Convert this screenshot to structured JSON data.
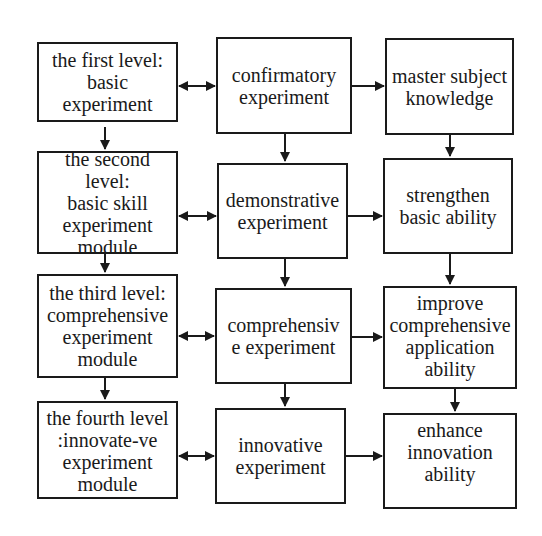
{
  "diagram": {
    "type": "flowchart",
    "colors": {
      "stroke": "#1a1a1a",
      "background": "#ffffff",
      "text": "#1a1a1a"
    },
    "columns": {
      "levels": [
        {
          "id": "level1",
          "label": "the first level:\nbasic\nexperiment"
        },
        {
          "id": "level2",
          "label": "the second level:\nbasic skill\nexperiment\nmodule"
        },
        {
          "id": "level3",
          "label": "the third level:\ncomprehensive\nexperiment\nmodule"
        },
        {
          "id": "level4",
          "label": "the fourth level\n:innovate-ve\nexperiment\nmodule"
        }
      ],
      "experiments": [
        {
          "id": "exp1",
          "label": "confirmatory\nexperiment"
        },
        {
          "id": "exp2",
          "label": "demonstrative\nexperiment"
        },
        {
          "id": "exp3",
          "label": "comprehensiv\ne experiment"
        },
        {
          "id": "exp4",
          "label": "innovative\nexperiment"
        }
      ],
      "outcomes": [
        {
          "id": "out1",
          "label": "master subject\nknowledge"
        },
        {
          "id": "out2",
          "label": "strengthen\nbasic ability"
        },
        {
          "id": "out3",
          "label": "improve\ncomprehensive\napplication\nability"
        },
        {
          "id": "out4",
          "label": "enhance\ninnovation\nability"
        }
      ]
    },
    "edges": [
      {
        "from": "level1",
        "to": "exp1",
        "type": "bidirectional"
      },
      {
        "from": "level2",
        "to": "exp2",
        "type": "bidirectional"
      },
      {
        "from": "level3",
        "to": "exp3",
        "type": "bidirectional"
      },
      {
        "from": "level4",
        "to": "exp4",
        "type": "bidirectional"
      },
      {
        "from": "exp1",
        "to": "out1",
        "type": "directed"
      },
      {
        "from": "exp2",
        "to": "out2",
        "type": "directed"
      },
      {
        "from": "exp3",
        "to": "out3",
        "type": "directed"
      },
      {
        "from": "exp4",
        "to": "out4",
        "type": "directed"
      },
      {
        "from": "level1",
        "to": "level2",
        "type": "directed"
      },
      {
        "from": "level2",
        "to": "level3",
        "type": "directed"
      },
      {
        "from": "level3",
        "to": "level4",
        "type": "directed"
      },
      {
        "from": "exp1",
        "to": "exp2",
        "type": "directed"
      },
      {
        "from": "exp2",
        "to": "exp3",
        "type": "directed"
      },
      {
        "from": "exp3",
        "to": "exp4",
        "type": "directed"
      },
      {
        "from": "out1",
        "to": "out2",
        "type": "directed"
      },
      {
        "from": "out2",
        "to": "out3",
        "type": "directed"
      },
      {
        "from": "out3",
        "to": "out4",
        "type": "directed"
      }
    ]
  }
}
